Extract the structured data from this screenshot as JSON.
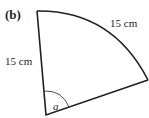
{
  "figure": {
    "label": "(b)",
    "radius_label": "15 cm",
    "arc_label": "15 cm",
    "angle_label": "a",
    "stroke_color": "#231f20"
  }
}
